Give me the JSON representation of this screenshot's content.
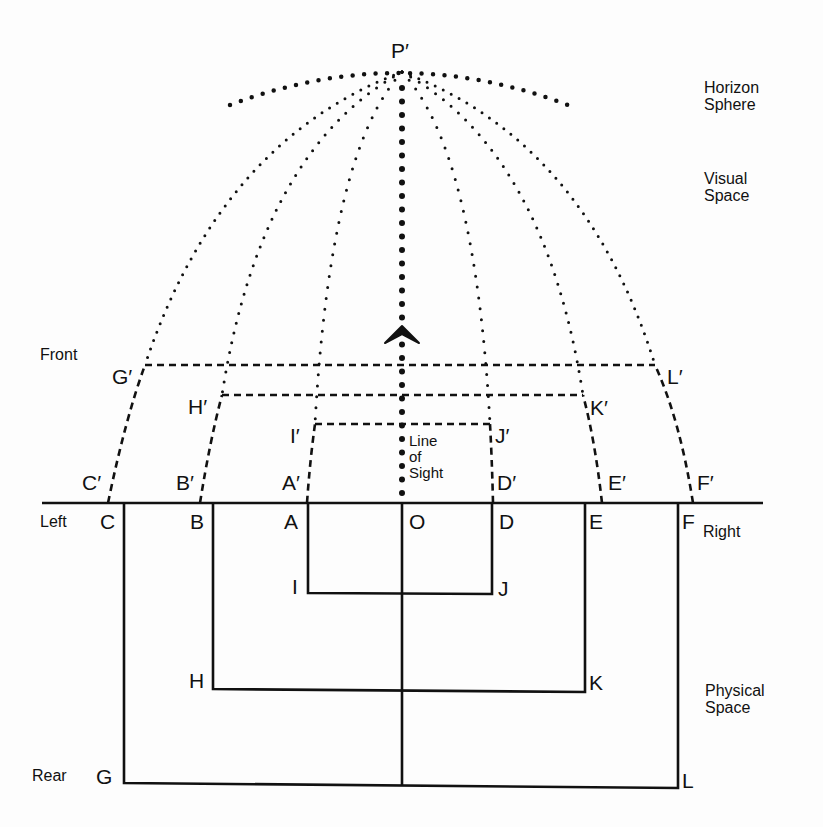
{
  "diagram": {
    "vanishing_point": "P′",
    "regions": {
      "horizon_sphere": "Horizon\nSphere",
      "visual_space": "Visual\nSpace",
      "physical_space": "Physical\nSpace"
    },
    "directions": {
      "front": "Front",
      "left": "Left",
      "right": "Right",
      "rear": "Rear"
    },
    "line_of_sight": "Line\nof\nSight",
    "physical_points": {
      "C": "C",
      "B": "B",
      "A": "A",
      "O": "O",
      "D": "D",
      "E": "E",
      "F": "F",
      "I": "I",
      "J": "J",
      "H": "H",
      "K": "K",
      "G": "G",
      "L": "L"
    },
    "visual_points": {
      "C": "C′",
      "B": "B′",
      "A": "A′",
      "D": "D′",
      "E": "E′",
      "F": "F′",
      "G": "G′",
      "H": "H′",
      "I": "I′",
      "J": "J′",
      "K": "K′",
      "L": "L′"
    },
    "colors": {
      "ink": "#111111",
      "paper": "#fdfdfd"
    }
  }
}
